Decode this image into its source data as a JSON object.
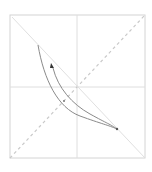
{
  "diagram": {
    "frame": {
      "x": 10,
      "y": 15,
      "width": 135,
      "height": 143,
      "stroke": "#d4d4d4"
    },
    "crosshair": {
      "vx": 77,
      "hy": 87,
      "stroke": "#dedede"
    },
    "diagonal_dashed": {
      "x1": 10,
      "y1": 158,
      "x2": 145,
      "y2": 15,
      "stroke": "#c9c9c9"
    },
    "diagonal_solid": {
      "x1": 12,
      "y1": 17,
      "x2": 145,
      "y2": 158,
      "stroke": "#e0e0e0"
    },
    "curves": [
      {
        "name": "outer-curve",
        "path": "M38 45 C 44 80, 58 108, 80 116 S 108 125, 117 129",
        "stroke": "#8a8a8a"
      },
      {
        "name": "inner-curve",
        "path": "M53 68 C 58 88, 72 104, 90 114 S 110 124, 117 129",
        "stroke": "#8a8a8a"
      }
    ],
    "arrowhead": {
      "x": 52,
      "y": 66,
      "color": "#333333"
    },
    "marker_dot": {
      "x": 64,
      "y": 101,
      "color": "#7a7a7a"
    },
    "end_point": {
      "x": 117,
      "y": 129,
      "color": "#555555"
    }
  }
}
